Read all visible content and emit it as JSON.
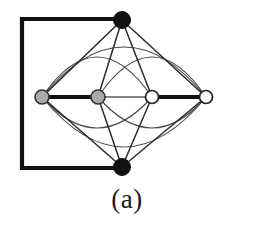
{
  "figure": {
    "caption": "(a)",
    "background_color": "#ffffff",
    "stroke_color": "#1a1a1a",
    "thin_stroke_color": "#555555",
    "curve_stroke_color": "#4a4a4a"
  },
  "chart_data": {
    "type": "diagram",
    "title": "(a)",
    "nodes": [
      {
        "id": "top",
        "label": "top-vertex",
        "x": 122,
        "y": 20,
        "r": 8.5,
        "fill": "#111111",
        "stroke": "#111111",
        "style": "filled-black"
      },
      {
        "id": "n1",
        "label": "row-vertex-1",
        "x": 42,
        "y": 97,
        "r": 7.0,
        "fill": "#a9a9a9",
        "stroke": "#333333",
        "style": "gray"
      },
      {
        "id": "n2",
        "label": "row-vertex-2",
        "x": 98,
        "y": 97,
        "r": 7.0,
        "fill": "#a9a9a9",
        "stroke": "#333333",
        "style": "gray"
      },
      {
        "id": "n3",
        "label": "row-vertex-3",
        "x": 152,
        "y": 97,
        "r": 6.5,
        "fill": "#ffffff",
        "stroke": "#222222",
        "style": "white"
      },
      {
        "id": "n4",
        "label": "row-vertex-4",
        "x": 206,
        "y": 97,
        "r": 6.5,
        "fill": "#ffffff",
        "stroke": "#222222",
        "style": "white"
      },
      {
        "id": "bottom",
        "label": "bottom-vertex",
        "x": 122,
        "y": 167,
        "r": 8.5,
        "fill": "#111111",
        "stroke": "#111111",
        "style": "filled-black"
      }
    ],
    "thick_frame": {
      "label": "bold-rectangle-path",
      "x": 22,
      "y": 19,
      "width": 100,
      "height": 149,
      "stroke_width": 4.2,
      "sides": [
        "top",
        "left",
        "bottom"
      ]
    },
    "edges": [
      {
        "from": "n1",
        "to": "n2",
        "kind": "straight",
        "weight": "thick"
      },
      {
        "from": "n3",
        "to": "n4",
        "kind": "straight",
        "weight": "thick"
      },
      {
        "from": "n2",
        "to": "n3",
        "kind": "straight",
        "weight": "thin"
      },
      {
        "from": "top",
        "to": "n1",
        "kind": "straight",
        "weight": "thin"
      },
      {
        "from": "top",
        "to": "n2",
        "kind": "straight",
        "weight": "thin"
      },
      {
        "from": "top",
        "to": "n3",
        "kind": "straight",
        "weight": "thin"
      },
      {
        "from": "top",
        "to": "n4",
        "kind": "straight",
        "weight": "thin"
      },
      {
        "from": "bottom",
        "to": "n1",
        "kind": "straight",
        "weight": "thin"
      },
      {
        "from": "bottom",
        "to": "n2",
        "kind": "straight",
        "weight": "thin"
      },
      {
        "from": "bottom",
        "to": "n3",
        "kind": "straight",
        "weight": "thin"
      },
      {
        "from": "bottom",
        "to": "n4",
        "kind": "straight",
        "weight": "thin"
      },
      {
        "from": "n1",
        "to": "n4",
        "kind": "arc-upper",
        "weight": "thin"
      },
      {
        "from": "n1",
        "to": "n4",
        "kind": "arc-lower",
        "weight": "thin"
      },
      {
        "from": "n1",
        "to": "n3",
        "kind": "arc-upper-inner",
        "weight": "thin"
      },
      {
        "from": "n2",
        "to": "n4",
        "kind": "arc-upper-inner",
        "weight": "thin"
      },
      {
        "from": "n1",
        "to": "n3",
        "kind": "arc-lower-inner",
        "weight": "thin"
      },
      {
        "from": "n2",
        "to": "n4",
        "kind": "arc-lower-inner",
        "weight": "thin"
      }
    ]
  }
}
